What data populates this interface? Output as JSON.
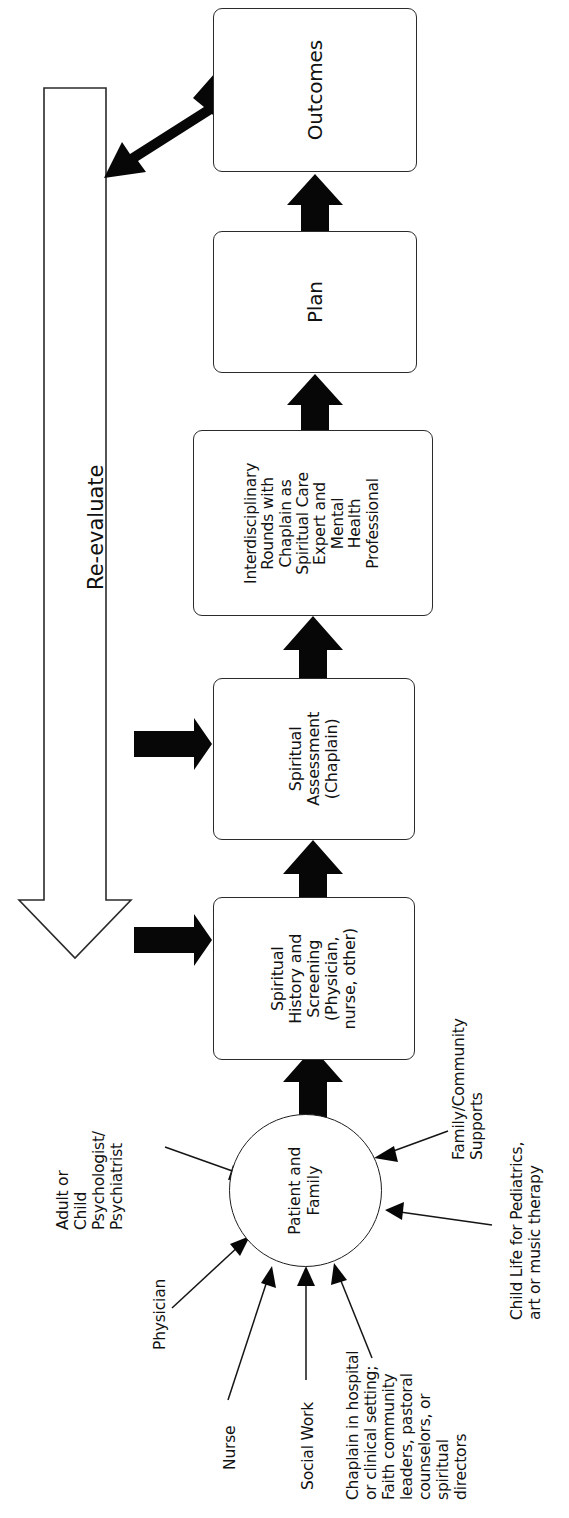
{
  "diagram": {
    "orientation": "rotated-90-ccw",
    "colors": {
      "background": "#ffffff",
      "stroke": "#1d1d1d",
      "arrow_fill": "#070707",
      "box_fill": "#ffffff"
    }
  },
  "nodes": {
    "outcomes": {
      "label": "Outcomes"
    },
    "plan": {
      "label": "Plan"
    },
    "rounds": {
      "label": "Interdisciplinary\nRounds with\nChaplain as\nSpiritual Care\nExpert and\nMental\nHealth\nProfessional"
    },
    "assessment": {
      "label": "Spiritual\nAssessment\n(Chaplain)"
    },
    "history": {
      "label": "Spiritual\nHistory and\nScreening\n(Physician,\nnurse, other)"
    },
    "center": {
      "label": "Patient and\nFamily"
    }
  },
  "feedback_arrow": {
    "label": "Re-evaluate"
  },
  "contributors": [
    {
      "key": "psych",
      "label": "Adult or\nChild\nPsychologist/\nPsychiatrist"
    },
    {
      "key": "physician",
      "label": "Physician"
    },
    {
      "key": "nurse",
      "label": "Nurse"
    },
    {
      "key": "social",
      "label": "Social Work"
    },
    {
      "key": "chaplain",
      "label": "Chaplain in hospital\nor clinical setting;\nFaith community\nleaders, pastoral\ncounselors, or\nspiritual\ndirectors"
    },
    {
      "key": "family",
      "label": "Family/Community\nSupports"
    },
    {
      "key": "childlife",
      "label": "Child Life for Pediatrics,\nart or music therapy"
    }
  ],
  "flow_sequence": [
    "Patient and Family",
    "Spiritual History and Screening (Physician, nurse, other)",
    "Spiritual Assessment (Chaplain)",
    "Interdisciplinary Rounds with Chaplain as Spiritual Care Expert and Mental Health Professional",
    "Plan",
    "Outcomes"
  ]
}
